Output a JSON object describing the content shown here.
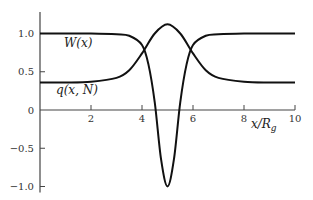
{
  "chart_data": {
    "type": "line",
    "title": "",
    "xlabel": "x/R_g",
    "ylabel": "",
    "xlim": [
      0,
      10
    ],
    "ylim": [
      -1.1,
      1.25
    ],
    "grid": false,
    "legend": "inline labels",
    "x_ticks": [
      2,
      4,
      6,
      8,
      10
    ],
    "x_tick_labels": [
      "2",
      "4",
      "6",
      "8",
      "10"
    ],
    "y_ticks": [
      1.0,
      0.5,
      0,
      -0.5,
      -1.0
    ],
    "y_tick_labels": [
      "1.0",
      "0.5",
      "0",
      "−0.5",
      "−1.0"
    ],
    "series": [
      {
        "name": "W(x)",
        "description": "well-shaped potential: 1.0 far from center, dips to -1.0 at x=5",
        "x": [
          0,
          1,
          2,
          3,
          3.5,
          4,
          4.25,
          4.5,
          4.75,
          5,
          5.25,
          5.5,
          5.75,
          6,
          6.5,
          7,
          8,
          9,
          10
        ],
        "values": [
          1.0,
          1.0,
          1.0,
          0.99,
          0.97,
          0.85,
          0.6,
          0.1,
          -0.65,
          -1.0,
          -0.65,
          0.1,
          0.6,
          0.85,
          0.97,
          0.99,
          1.0,
          1.0,
          1.0
        ]
      },
      {
        "name": "q(x, N)",
        "description": "profile: ~0.36 far from center, peaks at ~1.12 at x=5",
        "x": [
          0,
          1,
          2,
          3,
          3.5,
          4,
          4.5,
          5,
          5.5,
          6,
          6.5,
          7,
          8,
          9,
          10
        ],
        "values": [
          0.36,
          0.36,
          0.37,
          0.42,
          0.52,
          0.74,
          1.0,
          1.12,
          1.0,
          0.74,
          0.52,
          0.42,
          0.37,
          0.36,
          0.36
        ]
      }
    ],
    "annotations": [
      {
        "text": "W(x)",
        "x": 1.5,
        "y": 0.82
      },
      {
        "text": "q(x, N)",
        "x": 1.5,
        "y": 0.18
      }
    ]
  },
  "labels": {
    "w_curve": "W(x)",
    "q_curve": "q(x, N)",
    "x_axis": "x/R",
    "x_axis_sub": "g"
  }
}
